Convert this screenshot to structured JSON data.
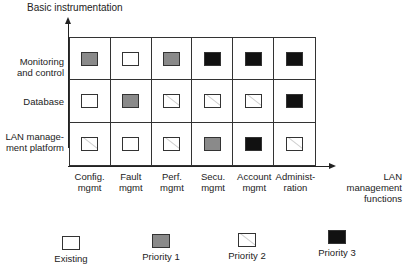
{
  "title_y_axis": "Basic instrumentation",
  "title_x_axis": "LAN management functions",
  "rows": [
    {
      "label": "Monitoring and control",
      "cells": [
        "p1",
        "existing",
        "p1",
        "p3",
        "p3",
        "p3"
      ]
    },
    {
      "label": "Database",
      "cells": [
        "existing",
        "p1",
        "p2",
        "p2",
        "p2",
        "p3"
      ]
    },
    {
      "label": "LAN manage-ment platform",
      "cells": [
        "p2",
        "existing",
        "p2",
        "p1",
        "p3",
        "p2"
      ]
    }
  ],
  "columns": [
    {
      "line1": "Config.",
      "line2": "mgmt"
    },
    {
      "line1": "Fault",
      "line2": "mgmt"
    },
    {
      "line1": "Perf.",
      "line2": "mgmt"
    },
    {
      "line1": "Secu.",
      "line2": "mgmt"
    },
    {
      "line1": "Account",
      "line2": "mgmt"
    },
    {
      "line1": "Administ-",
      "line2": "ration"
    }
  ],
  "row_labels": {
    "r0_l1": "Monitoring",
    "r0_l2": "and control",
    "r1_l1": "Database",
    "r2_l1": "LAN manage-",
    "r2_l2": "ment platform"
  },
  "x_title": {
    "line1": "LAN management",
    "line2": "functions"
  },
  "legend": [
    {
      "key": "existing",
      "label": "Existing"
    },
    {
      "key": "p1",
      "label": "Priority 1"
    },
    {
      "key": "p2",
      "label": "Priority 2"
    },
    {
      "key": "p3",
      "label": "Priority 3"
    }
  ],
  "colors": {
    "existing": "#ffffff",
    "priority_1": "#8a8a8a",
    "priority_2": "#ffffff",
    "priority_3": "#111111"
  }
}
